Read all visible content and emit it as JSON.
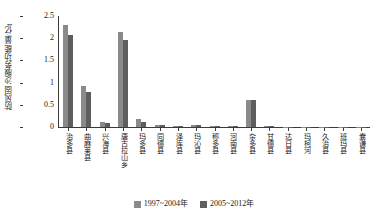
{
  "chart_data": {
    "type": "bar",
    "title": "",
    "xlabel": "",
    "ylabel": "防风固沙服务功能量/亿t",
    "ylim": [
      0,
      2.5
    ],
    "yticks": [
      0,
      0.5,
      1,
      1.5,
      2,
      2.5
    ],
    "ytick_labels": [
      "0",
      "0.5",
      "1",
      "1.5",
      "2",
      "2.5"
    ],
    "grid": false,
    "legend_position": "bottom-center",
    "categories": [
      "治多县",
      "曲麻莱县",
      "兴海县",
      "唐古拉山乡",
      "玛多县",
      "同德县",
      "泽库县",
      "玛沁县",
      "称多县",
      "河南县",
      "杂多县",
      "甘德县",
      "达日县",
      "玛柯河",
      "久治县",
      "班玛县",
      "囊谦县"
    ],
    "series": [
      {
        "name": "1997~2004年",
        "color": "#8a8a8a",
        "values": [
          2.3,
          0.93,
          0.12,
          2.13,
          0.18,
          0.05,
          0.02,
          0.05,
          0.02,
          0.03,
          0.61,
          0.02,
          0.01,
          0.01,
          0.01,
          0.01,
          0.01
        ]
      },
      {
        "name": "2005~2012年",
        "color": "#5e5e5e",
        "values": [
          2.08,
          0.78,
          0.1,
          1.96,
          0.11,
          0.04,
          0.02,
          0.04,
          0.02,
          0.02,
          0.6,
          0.02,
          0.01,
          0.01,
          0.01,
          0.01,
          0.01
        ]
      }
    ]
  },
  "legend": {
    "items": [
      {
        "label": "1997~2004年"
      },
      {
        "label": "2005~2012年"
      }
    ]
  }
}
